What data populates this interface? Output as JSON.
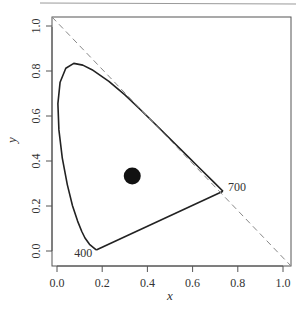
{
  "chart_data": {
    "type": "line",
    "title": "",
    "xlabel": "x",
    "ylabel": "y",
    "xlim": [
      0.0,
      1.0
    ],
    "ylim": [
      0.0,
      1.0
    ],
    "x_ticks": [
      "0.0",
      "0.2",
      "0.4",
      "0.6",
      "0.8",
      "1.0"
    ],
    "y_ticks": [
      "0.0",
      "0.2",
      "0.4",
      "0.6",
      "0.8",
      "1.0"
    ],
    "grid": false,
    "legend": null,
    "series": [
      {
        "name": "spectral locus",
        "style": "solid",
        "points": [
          [
            0.1733,
            0.0048
          ],
          [
            0.144,
            0.0297
          ],
          [
            0.1241,
            0.0578
          ],
          [
            0.1096,
            0.0868
          ],
          [
            0.0913,
            0.1327
          ],
          [
            0.0687,
            0.2007
          ],
          [
            0.0454,
            0.295
          ],
          [
            0.0235,
            0.4127
          ],
          [
            0.0082,
            0.5384
          ],
          [
            0.0039,
            0.6548
          ],
          [
            0.0139,
            0.7502
          ],
          [
            0.0389,
            0.812
          ],
          [
            0.0743,
            0.8338
          ],
          [
            0.1142,
            0.8262
          ],
          [
            0.1547,
            0.8059
          ],
          [
            0.2296,
            0.7543
          ],
          [
            0.3016,
            0.6923
          ],
          [
            0.3731,
            0.6245
          ],
          [
            0.4441,
            0.5547
          ],
          [
            0.5125,
            0.4866
          ],
          [
            0.5752,
            0.4242
          ],
          [
            0.627,
            0.3725
          ],
          [
            0.6915,
            0.3083
          ],
          [
            0.7347,
            0.2653
          ]
        ]
      },
      {
        "name": "line of purples",
        "style": "solid",
        "points": [
          [
            0.7347,
            0.2653
          ],
          [
            0.1733,
            0.0048
          ]
        ]
      },
      {
        "name": "x + y = 1",
        "style": "dashed",
        "points": [
          [
            -0.04,
            1.04
          ],
          [
            1.04,
            -0.04
          ]
        ]
      },
      {
        "name": "white point",
        "type": "scatter",
        "points": [
          [
            0.333,
            0.333
          ]
        ]
      }
    ],
    "annotations": [
      {
        "text": "400",
        "x": 0.1733,
        "y": 0.0048
      },
      {
        "text": "700",
        "x": 0.7347,
        "y": 0.2653
      }
    ]
  }
}
